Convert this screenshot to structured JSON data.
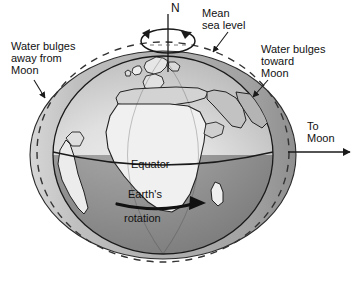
{
  "figure": {
    "background_color": "#ffffff",
    "title": ""
  },
  "labels": {
    "north_pole": "N",
    "mean_sea_level": "Mean\nsea level",
    "mean_sea_level_line1": "Mean",
    "mean_sea_level_line2": "sea level",
    "bulge_away_line1": "Water bulges",
    "bulge_away_line2": "away from",
    "bulge_away_line3": "Moon",
    "bulge_toward_line1": "Water bulges",
    "bulge_toward_line2": "toward",
    "bulge_toward_line3": "Moon",
    "to_moon_line1": "To",
    "to_moon_line2": "Moon",
    "equator": "Equator",
    "rotation_line1": "Earth's",
    "rotation_line2": "rotation"
  },
  "colors": {
    "outline": "#1a1a1a",
    "bulge_fill": "#b4b4b4",
    "earth_north_light": "#e8e8e8",
    "earth_north_mid": "#d2d2d2",
    "earth_south_dark": "#8e8e8e",
    "earth_south_mid": "#a8a8a8",
    "land_fill": "#f4f4f4",
    "land_fill_shaded": "#bdbdbd",
    "dashed_line": "#3a3a3a",
    "text": "#111111",
    "background": "#ffffff"
  },
  "geometry": {
    "earth_center_x": 163,
    "earth_center_y": 155,
    "earth_radius_x": 110,
    "earth_radius_y": 99,
    "bulge_radius_x": 133,
    "bulge_radius_y": 104,
    "dashed_radius_x": 127,
    "dashed_radius_y": 110,
    "pole_axis_top_y": 14,
    "rotation_ellipse_cx": 168,
    "rotation_ellipse_cy": 40
  },
  "annotations": {
    "to_moon_arrow_direction": "right",
    "rotation_arrow_direction": "eastward",
    "spin_arrow_direction": "counterclockwise-from-north"
  }
}
